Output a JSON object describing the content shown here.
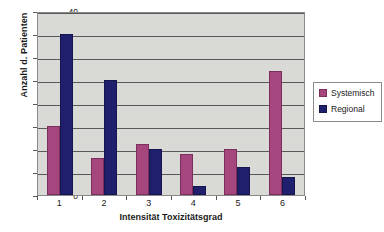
{
  "chart_data": {
    "type": "bar",
    "title": "",
    "xlabel": "Intensität Toxizitätsgrad",
    "ylabel": "Anzahl d. Patienten",
    "categories": [
      "1",
      "2",
      "3",
      "4",
      "5",
      "6"
    ],
    "series": [
      {
        "name": "Systemisch",
        "color": "#a6467e",
        "values": [
          15,
          8,
          11,
          9,
          10,
          27
        ]
      },
      {
        "name": "Regional",
        "color": "#1f1f6e",
        "values": [
          35,
          25,
          10,
          2,
          6,
          4
        ]
      }
    ],
    "ylim": [
      0,
      40
    ],
    "yticks": [
      0,
      5,
      10,
      15,
      20,
      25,
      30,
      35,
      40
    ],
    "grid": true,
    "legend_position": "right",
    "plot_background": "#d9d9d6"
  }
}
